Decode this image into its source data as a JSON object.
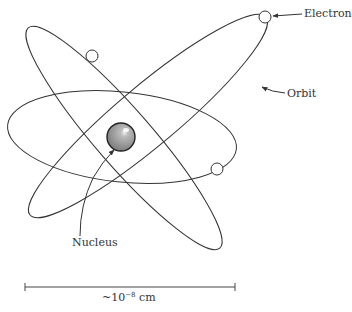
{
  "diagram": {
    "type": "atom-model",
    "labels": {
      "electron": "Electron",
      "orbit": "Orbit",
      "nucleus": "Nucleus",
      "scale_prefix": "~10",
      "scale_exponent": "−8",
      "scale_unit": " cm"
    },
    "colors": {
      "line": "#333333",
      "nucleus_fill": "#9a9a9a",
      "nucleus_highlight": "#e8e8e8",
      "electron_fill": "#ffffff",
      "background": "#ffffff"
    },
    "orbits": [
      {
        "name": "horizontal-orbit",
        "cx": 122,
        "cy": 137,
        "rx": 115,
        "ry": 45,
        "rotate": 6
      },
      {
        "name": "ascending-orbit",
        "cx": 148,
        "cy": 116,
        "rx": 154,
        "ry": 30,
        "rotate": -40
      },
      {
        "name": "descending-orbit",
        "cx": 124,
        "cy": 138,
        "rx": 146,
        "ry": 28,
        "rotate": 49
      }
    ],
    "electrons": [
      {
        "name": "electron-top-right",
        "cx": 265,
        "cy": 17,
        "r": 6
      },
      {
        "name": "electron-top-left",
        "cx": 92,
        "cy": 56,
        "r": 6
      },
      {
        "name": "electron-right",
        "cx": 217,
        "cy": 169,
        "r": 6
      }
    ],
    "nucleus": {
      "cx": 121,
      "cy": 137,
      "r": 14
    },
    "scale_bar": {
      "x1": 25,
      "x2": 235,
      "y": 287
    }
  }
}
